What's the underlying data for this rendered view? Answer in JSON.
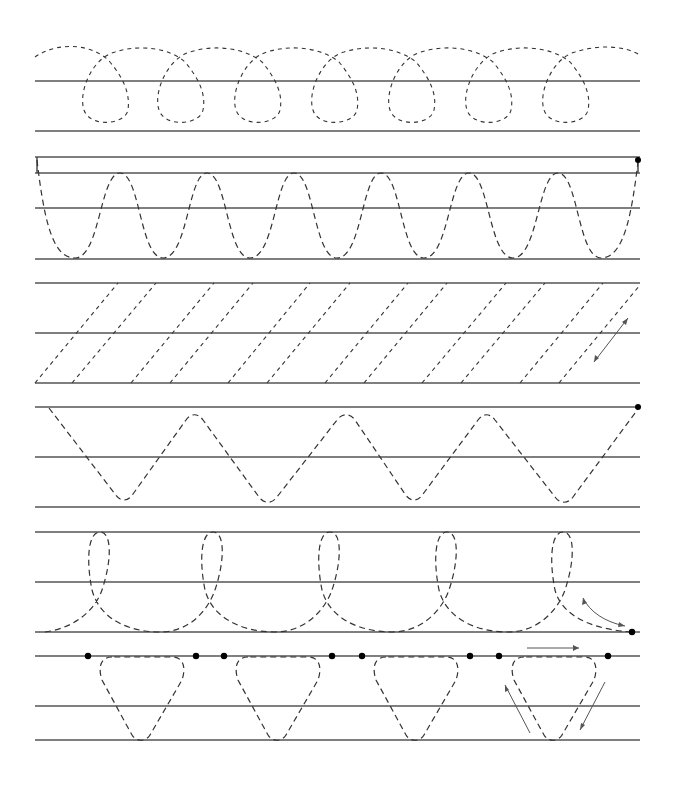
{
  "worksheet": {
    "title": "Handwriting tracing practice",
    "colors": {
      "background": "#ffffff",
      "rule": "#555555",
      "trace": "#333333",
      "dot": "#000000"
    },
    "rows": [
      {
        "id": "row-1",
        "pattern": "cursive-loops",
        "count": 7,
        "lines_y": [
          81,
          131
        ]
      },
      {
        "id": "row-2",
        "pattern": "sine-waves",
        "count": 6,
        "lines_y": [
          157,
          173,
          208,
          259
        ],
        "end_marker": "dot"
      },
      {
        "id": "row-3",
        "pattern": "diagonal-slashes",
        "count": 13,
        "lines_y": [
          283,
          333,
          383
        ],
        "direction_hint": "double-arrow-diagonal"
      },
      {
        "id": "row-4",
        "pattern": "zigzag-v",
        "count": 4,
        "lines_y": [
          407,
          457,
          507
        ],
        "end_marker": "dot"
      },
      {
        "id": "row-5",
        "pattern": "tall-loops",
        "count": 5,
        "lines_y": [
          532,
          582,
          632
        ],
        "end_marker": "dot",
        "direction_hint": "curved-arrow"
      },
      {
        "id": "row-6",
        "pattern": "inverted-triangles",
        "count": 4,
        "lines_y": [
          656,
          706,
          740
        ],
        "start_dots": 8,
        "direction_hint": "three-arrows"
      }
    ]
  }
}
